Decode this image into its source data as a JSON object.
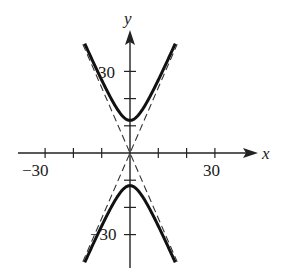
{
  "chart_data": {
    "type": "line",
    "title": "",
    "xlabel": "x",
    "ylabel": "y",
    "xlim": [
      -40,
      40
    ],
    "ylim": [
      -45,
      45
    ],
    "x_tick_labels": [
      "-30",
      "30"
    ],
    "y_tick_labels": [
      "30",
      "-30"
    ],
    "x_ticks": [
      -30,
      -20,
      -10,
      10,
      20,
      30
    ],
    "y_ticks": [
      -30,
      -20,
      -10,
      10,
      20,
      30
    ],
    "grid": false,
    "series": [
      {
        "name": "hyperbola upper branch",
        "style": "solid",
        "equation": "y^2/144 - x^2/25 = 1, y>0",
        "vertex": [
          0,
          12
        ]
      },
      {
        "name": "hyperbola lower branch",
        "style": "solid",
        "equation": "y^2/144 - x^2/25 = 1, y<0",
        "vertex": [
          0,
          -12
        ]
      },
      {
        "name": "asymptote 1",
        "style": "dashed",
        "equation": "y = 2.4x"
      },
      {
        "name": "asymptote 2",
        "style": "dashed",
        "equation": "y = -2.4x"
      }
    ]
  },
  "labels": {
    "x_axis": "x",
    "y_axis": "y",
    "x_neg": "−30",
    "x_pos": "30",
    "y_pos": "30",
    "y_neg": "−30"
  }
}
